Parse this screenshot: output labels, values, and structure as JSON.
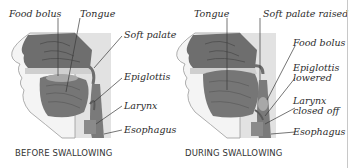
{
  "colors": {
    "tissue_dark": "#6e6e6e",
    "tissue_mid": "#8a8a8a",
    "tissue_light": "#bdbdbd",
    "background_box": "#e2e2e2",
    "skin": "#f4f4f4",
    "line": "#3a3a3a"
  },
  "panels": [
    {
      "caption": "BEFORE SWALLOWING",
      "labels": {
        "food_bolus": "Food bolus",
        "tongue": "Tongue",
        "soft_palate": "Soft palate",
        "epiglottis": "Epiglottis",
        "larynx": "Larynx",
        "esophagus": "Esophagus"
      }
    },
    {
      "caption": "DURING SWALLOWING",
      "labels": {
        "tongue": "Tongue",
        "soft_palate_raised": "Soft palate raised",
        "food_bolus": "Food bolus",
        "epiglottis_line1": "Epiglottis",
        "epiglottis_line2": "lowered",
        "larynx_line1": "Larynx",
        "larynx_line2": "closed off",
        "esophagus": "Esophagus"
      }
    }
  ]
}
